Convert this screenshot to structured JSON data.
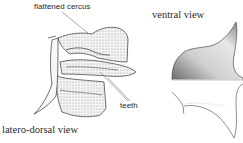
{
  "figure": {
    "labels": {
      "flattened_cercus": "flattened cercus",
      "teeth": "teeth",
      "latero_dorsal_view": "latero-dorsal view",
      "ventral_view": "ventral view"
    },
    "colors": {
      "background": "#ffffff",
      "ink": "#2a2a2a",
      "stipple_dark": "#555555",
      "stipple_light": "#bdbdbd"
    }
  }
}
